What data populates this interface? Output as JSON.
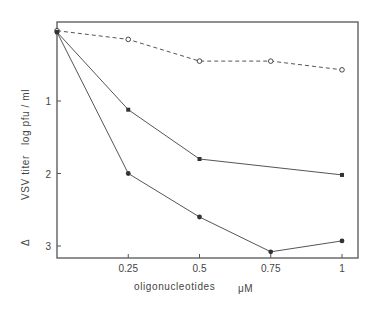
{
  "chart_data": {
    "type": "line",
    "title": "",
    "xlabel": "oligonucleotides",
    "xunit": "μM",
    "ylabel": "Δ VSV titer  log pfu / ml",
    "ylabel_parts": {
      "delta": "Δ",
      "main": "VSV titer",
      "unit": "log pfu / ml"
    },
    "x_ticks": [
      0.25,
      0.5,
      0.75,
      1
    ],
    "x_tick_labels": [
      "0.25",
      "0.5",
      "0.75",
      "1"
    ],
    "y_ticks": [
      1,
      2,
      3
    ],
    "y_tick_labels": [
      "1",
      "2",
      "3"
    ],
    "xlim": [
      0,
      1.05
    ],
    "ylim": [
      3.18,
      -0.08
    ],
    "y_inverted": true,
    "grid": false,
    "legend": null,
    "series": [
      {
        "name": "open circles (dashed)",
        "marker": "open-circle",
        "line": "dashed",
        "x": [
          0,
          0.25,
          0.5,
          0.75,
          1
        ],
        "values": [
          0.03,
          0.15,
          0.45,
          0.45,
          0.57
        ]
      },
      {
        "name": "filled squares (upper)",
        "marker": "filled-square",
        "line": "solid",
        "x": [
          0,
          0.25,
          0.5,
          1
        ],
        "values": [
          0.05,
          1.12,
          1.8,
          2.02
        ]
      },
      {
        "name": "filled circles (lower)",
        "marker": "filled-circle",
        "line": "solid",
        "x": [
          0,
          0.25,
          0.5,
          0.75,
          1
        ],
        "values": [
          0.05,
          2.0,
          2.6,
          3.08,
          2.93
        ]
      }
    ]
  },
  "colors": {
    "axis": "#555555",
    "line": "#555555",
    "marker": "#333333"
  }
}
